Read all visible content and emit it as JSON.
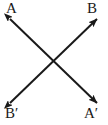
{
  "figure": {
    "width": 108,
    "height": 125,
    "background_color": "#ffffff",
    "stroke_color": "#1a1a1a",
    "stroke_width": 2,
    "labels": {
      "top_left": "A",
      "top_right": "B",
      "bottom_left": "B′",
      "bottom_right": "A′"
    },
    "arrows": [
      {
        "name": "arrow-A-to-Aprime",
        "from_label": "A",
        "to_label": "A′",
        "from_point": [
          10,
          19
        ],
        "to_point": [
          97,
          103
        ],
        "double_headed": true
      },
      {
        "name": "arrow-Bprime-to-B",
        "from_label": "B′",
        "to_label": "B",
        "from_point": [
          10,
          103
        ],
        "to_point": [
          97,
          19
        ],
        "double_headed": true
      }
    ],
    "intersection_point": [
      53.5,
      61
    ]
  }
}
